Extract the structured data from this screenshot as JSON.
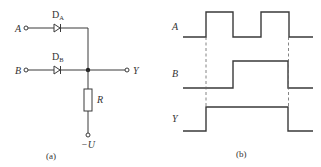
{
  "panel_a": {
    "caption": "(a)",
    "inputs": [
      {
        "label": "A",
        "diode": {
          "name": "D",
          "sub": "A"
        }
      },
      {
        "label": "B",
        "diode": {
          "name": "D",
          "sub": "B"
        }
      }
    ],
    "output_label": "Y",
    "resistor_label": "R",
    "supply_label": "−U"
  },
  "panel_b": {
    "caption": "(b)",
    "signals": [
      {
        "label": "A",
        "levels": "0,1,0,1,0",
        "transitions_x": [
          206,
          233,
          261,
          289
        ]
      },
      {
        "label": "B",
        "levels": "0,1,0",
        "transitions_x": [
          233,
          288
        ]
      },
      {
        "label": "Y",
        "levels": "0,1,0",
        "transitions_x": [
          206,
          288
        ]
      }
    ],
    "dashed_guides_x": [
      206,
      288
    ]
  },
  "colors": {
    "line": "#3a3a3a",
    "text": "#333333",
    "background": "#ffffff"
  }
}
